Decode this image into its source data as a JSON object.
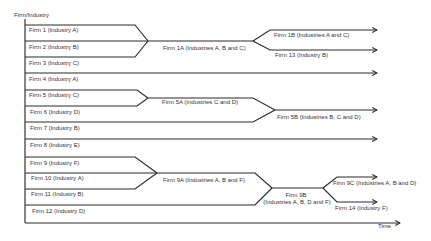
{
  "diagram": {
    "y_axis_label": "Firm/Industry",
    "x_axis_label": "Time",
    "firms": [
      {
        "label": "Firm 1 (Industry A)"
      },
      {
        "label": "Firm 2 (Industry B)"
      },
      {
        "label": "Firm 3 (Industry C)"
      },
      {
        "label": "Firm 4 (Industry A)"
      },
      {
        "label": "Firm 5 (Industry C)"
      },
      {
        "label": "Firm 6 (Industry D)"
      },
      {
        "label": "Firm 7 (Industry B)"
      },
      {
        "label": "Firm 8 (Industry E)"
      },
      {
        "label": "Firm 9 (Industry F)"
      },
      {
        "label": "Firm 10 (Industry A)"
      },
      {
        "label": "Firm 11 (Industry B)"
      },
      {
        "label": "Firm 12 (Industry D)"
      }
    ],
    "outcomes": {
      "firm_1a": "Firm 1A (Industries A, B and C)",
      "firm_1b": "Firm 1B (Industries A and C)",
      "firm_13": "Firm 13 (Industry B)",
      "firm_5a": "Firm 5A (Industries C and D)",
      "firm_5b": "Firm 5B (Industries B, C and D)",
      "firm_9a": "Firm 9A (Industries A, B and F)",
      "firm_9b_name": "Firm 9B",
      "firm_9b_industries": "(Industries A, B, D and F)",
      "firm_9c": "Firm 9C (Industries A, B and D)",
      "firm_14": "Firm 14 (Industry F)"
    },
    "events": [
      {
        "type": "merge",
        "from": [
          "Firm 1",
          "Firm 2",
          "Firm 3"
        ],
        "to": "Firm 1A"
      },
      {
        "type": "split",
        "from": "Firm 1A",
        "to": [
          "Firm 1B",
          "Firm 13"
        ]
      },
      {
        "type": "merge",
        "from": [
          "Firm 5",
          "Firm 6"
        ],
        "to": "Firm 5A"
      },
      {
        "type": "merge",
        "from": [
          "Firm 5A",
          "Firm 7"
        ],
        "to": "Firm 5B"
      },
      {
        "type": "merge",
        "from": [
          "Firm 9",
          "Firm 10",
          "Firm 11"
        ],
        "to": "Firm 9A"
      },
      {
        "type": "merge",
        "from": [
          "Firm 9A",
          "Firm 12"
        ],
        "to": "Firm 9B"
      },
      {
        "type": "split",
        "from": "Firm 9B",
        "to": [
          "Firm 9C",
          "Firm 14"
        ]
      }
    ],
    "continuing_unchanged": [
      "Firm 4",
      "Firm 8"
    ]
  },
  "colors": {
    "line": "#2b2b2b",
    "text": "#333333",
    "background": "#ffffff"
  }
}
